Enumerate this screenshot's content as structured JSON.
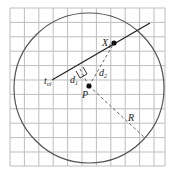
{
  "diagram": {
    "labels": {
      "tol": "t",
      "tol_sub": "ol",
      "x1": "X",
      "x1_sub": "1",
      "d1": "d",
      "d1_sub": "1",
      "d2": "d",
      "d2_sub": "2",
      "p": "P",
      "r": "R"
    },
    "colors": {
      "grid": "#bdbdbd",
      "circle": "#555555",
      "line": "#222222",
      "dashed": "#555555",
      "point": "#111111"
    }
  }
}
